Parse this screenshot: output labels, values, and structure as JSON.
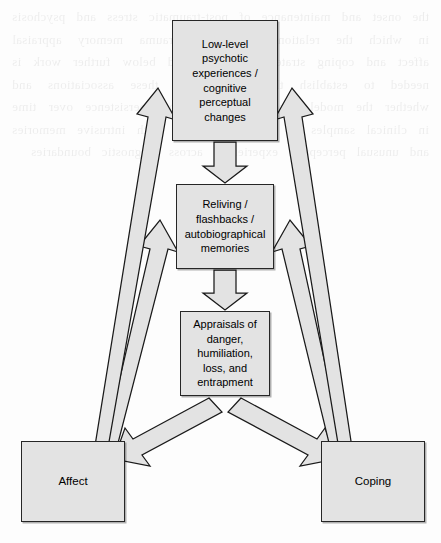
{
  "figure": {
    "type": "flow-diagram",
    "title": "",
    "background_artifact": "faint mirrored bleed-through text from reverse side of scanned page"
  },
  "nodes": [
    {
      "id": "low-level-psychotic",
      "label": "Low-level psychotic experiences / cognitive perceptual changes"
    },
    {
      "id": "reliving-flashbacks",
      "label": "Reliving / flashbacks / autobiographical memories"
    },
    {
      "id": "appraisals",
      "label": "Appraisals of danger, humiliation, loss, and entrapment"
    },
    {
      "id": "affect",
      "label": "Affect"
    },
    {
      "id": "coping",
      "label": "Coping"
    }
  ],
  "edges": [
    {
      "from": "low-level-psychotic",
      "to": "reliving-flashbacks",
      "style": "block-arrow",
      "direction": "down"
    },
    {
      "from": "reliving-flashbacks",
      "to": "appraisals",
      "style": "block-arrow",
      "direction": "down"
    },
    {
      "from": "appraisals",
      "to": "affect",
      "style": "block-arrow",
      "direction": "down-left"
    },
    {
      "from": "appraisals",
      "to": "coping",
      "style": "block-arrow",
      "direction": "down-right"
    },
    {
      "from": "affect",
      "to": "low-level-psychotic",
      "style": "block-arrow",
      "direction": "up-right"
    },
    {
      "from": "affect",
      "to": "reliving-flashbacks",
      "style": "block-arrow",
      "direction": "up-right"
    },
    {
      "from": "coping",
      "to": "low-level-psychotic",
      "style": "block-arrow",
      "direction": "up-left"
    },
    {
      "from": "coping",
      "to": "reliving-flashbacks",
      "style": "block-arrow",
      "direction": "up-left"
    }
  ],
  "colors": {
    "box_fill": "#e3e3e3",
    "box_stroke": "#262626",
    "arrow_fill": "#e3e3e3",
    "arrow_stroke": "#1a1a1a",
    "page_background": "#fdfdfd",
    "text": "#000000"
  },
  "ghost_text": "the onset and maintenance of post-traumatic stress and psychosis in which the relationship between trauma memory appraisal affect and coping strategies is described below further work is needed to establish the direction of these associations and whether the model accounts for symptom persistence over time in clinical samples of patients reporting both intrusive memories and unusual perceptual experiences across diagnostic boundaries"
}
